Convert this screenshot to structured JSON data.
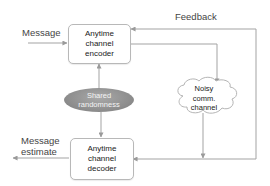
{
  "diagram": {
    "labels": {
      "message": "Message",
      "feedback": "Feedback",
      "message_estimate_line1": "Message",
      "message_estimate_line2": "estimate"
    },
    "nodes": {
      "encoder": {
        "line1": "Anytime",
        "line2": "channel",
        "line3": "encoder"
      },
      "decoder": {
        "line1": "Anytime",
        "line2": "channel",
        "line3": "decoder"
      },
      "shared_randomness": {
        "line1": "Shared",
        "line2": "randomness"
      },
      "channel": {
        "line1": "Noisy",
        "line2": "comm.",
        "line3": "channel"
      }
    },
    "edges": [
      {
        "from": "Message",
        "to": "encoder"
      },
      {
        "from": "encoder",
        "to": "channel"
      },
      {
        "from": "channel",
        "to": "decoder"
      },
      {
        "from": "channel",
        "to": "encoder",
        "label": "Feedback"
      },
      {
        "from": "shared_randomness",
        "to": "encoder"
      },
      {
        "from": "shared_randomness",
        "to": "decoder"
      },
      {
        "from": "decoder",
        "to": "Message estimate"
      }
    ],
    "colors": {
      "line": "#9a9a9a",
      "box_border": "#b8b8b8",
      "ellipse_fill": "#8f8f8f",
      "ellipse_text": "#f4f4f4",
      "text": "#222222"
    }
  }
}
